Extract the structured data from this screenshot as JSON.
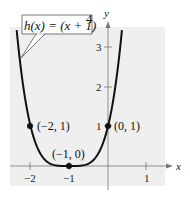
{
  "chart_data": {
    "type": "line",
    "title": "",
    "function_label": "h(x) = (x + 1)^4",
    "equation": {
      "lhs": "h(x) = (x + 1)",
      "exponent": "4"
    },
    "xlabel": "x",
    "ylabel": "y",
    "xlim": [
      -2.3,
      1.6
    ],
    "ylim": [
      -0.4,
      3.5
    ],
    "grid": false,
    "background": "#efefef",
    "curve_color": "#111111",
    "x_ticks": [
      {
        "value": -2,
        "label": "−2"
      },
      {
        "value": -1,
        "label": "−1"
      },
      {
        "value": 1,
        "label": "1"
      }
    ],
    "y_ticks": [
      {
        "value": 1,
        "label": "1"
      },
      {
        "value": 2,
        "label": "2"
      },
      {
        "value": 3,
        "label": "3"
      }
    ],
    "series": [
      {
        "name": "h(x) = (x + 1)^4",
        "x": [
          -2.37,
          -2.3,
          -2.2,
          -2.1,
          -2.0,
          -1.9,
          -1.8,
          -1.7,
          -1.6,
          -1.5,
          -1.4,
          -1.3,
          -1.2,
          -1.1,
          -1.0,
          -0.9,
          -0.8,
          -0.7,
          -0.6,
          -0.5,
          -0.4,
          -0.3,
          -0.2,
          -0.1,
          0.0,
          0.1,
          0.2,
          0.3,
          0.37
        ],
        "y": [
          3.52,
          2.86,
          2.07,
          1.46,
          1.0,
          0.656,
          0.41,
          0.24,
          0.13,
          0.0625,
          0.0256,
          0.0081,
          0.0016,
          0.0001,
          0.0,
          0.0001,
          0.0016,
          0.0081,
          0.0256,
          0.0625,
          0.13,
          0.24,
          0.41,
          0.656,
          1.0,
          1.46,
          2.07,
          2.86,
          3.52
        ]
      }
    ],
    "points": [
      {
        "x": -2,
        "y": 1,
        "label": "(−2, 1)"
      },
      {
        "x": -1,
        "y": 0,
        "label": "(−1, 0)"
      },
      {
        "x": 0,
        "y": 1,
        "label": "(0, 1)"
      }
    ]
  }
}
